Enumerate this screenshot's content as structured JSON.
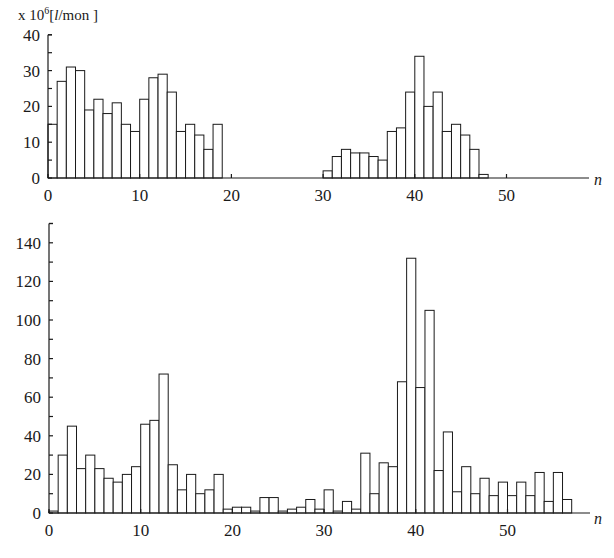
{
  "chart_data": [
    {
      "type": "bar",
      "title": "",
      "unit_label": "x 10^6 [l/mon]",
      "unit_prefix": "x 10",
      "unit_exp": "6",
      "unit_suffix": "[l/mon ]",
      "xlabel": "n",
      "ylabel": "",
      "xlim": [
        0,
        59
      ],
      "ylim": [
        0,
        40
      ],
      "x_ticks": [
        0,
        10,
        20,
        30,
        40,
        50
      ],
      "y_ticks": [
        0,
        10,
        20,
        30,
        40
      ],
      "grid": false,
      "categories": [
        0,
        1,
        2,
        3,
        4,
        5,
        6,
        7,
        8,
        9,
        10,
        11,
        12,
        13,
        14,
        15,
        16,
        17,
        18,
        19,
        20,
        21,
        22,
        23,
        24,
        25,
        26,
        27,
        28,
        29,
        30,
        31,
        32,
        33,
        34,
        35,
        36,
        37,
        38,
        39,
        40,
        41,
        42,
        43,
        44,
        45,
        46,
        47
      ],
      "values": [
        15,
        27,
        31,
        30,
        19,
        22,
        18,
        21,
        15,
        13,
        22,
        28,
        29,
        24,
        13,
        15,
        12,
        8,
        15,
        0,
        0,
        0,
        0,
        0,
        0,
        0,
        0,
        0,
        0,
        0,
        2,
        6,
        8,
        7,
        7,
        6,
        5,
        13,
        14,
        24,
        34,
        20,
        24,
        13,
        15,
        12,
        8,
        1
      ]
    },
    {
      "type": "bar",
      "title": "",
      "xlabel": "n",
      "ylabel": "",
      "xlim": [
        0,
        59
      ],
      "ylim": [
        0,
        150
      ],
      "x_ticks": [
        0,
        10,
        20,
        30,
        40,
        50
      ],
      "y_ticks": [
        0,
        20,
        40,
        60,
        80,
        100,
        120,
        140
      ],
      "grid": false,
      "categories": [
        0,
        1,
        2,
        3,
        4,
        5,
        6,
        7,
        8,
        9,
        10,
        11,
        12,
        13,
        14,
        15,
        16,
        17,
        18,
        19,
        20,
        21,
        22,
        23,
        24,
        25,
        26,
        27,
        28,
        29,
        30,
        31,
        32,
        33,
        34,
        35,
        36,
        37,
        38,
        39,
        40,
        41,
        42,
        43,
        44,
        45,
        46,
        47,
        48,
        49,
        50,
        51,
        52,
        53,
        54,
        55,
        56
      ],
      "values": [
        1,
        30,
        45,
        23,
        30,
        23,
        18,
        16,
        20,
        24,
        46,
        48,
        72,
        25,
        12,
        20,
        10,
        12,
        20,
        2,
        3,
        3,
        1,
        8,
        8,
        1,
        2,
        3,
        7,
        2,
        12,
        1,
        6,
        2,
        31,
        10,
        26,
        24,
        68,
        132,
        65,
        105,
        22,
        42,
        11,
        24,
        10,
        18,
        9,
        16,
        9,
        16,
        9,
        21,
        6,
        21,
        7
      ]
    }
  ],
  "labels": {
    "top_x_ticks": [
      "0",
      "10",
      "20",
      "30",
      "40",
      "50"
    ],
    "top_y_ticks": [
      "0",
      "10",
      "20",
      "30",
      "40"
    ],
    "bottom_x_ticks": [
      "0",
      "10",
      "20",
      "30",
      "40",
      "50"
    ],
    "bottom_y_ticks": [
      "0",
      "20",
      "40",
      "60",
      "80",
      "100",
      "120",
      "140"
    ],
    "x_axis_name": "n",
    "unit_prefix": "x 10",
    "unit_exp": "6",
    "unit_open": "[",
    "unit_l": "l",
    "unit_rest": "/mon ]"
  }
}
